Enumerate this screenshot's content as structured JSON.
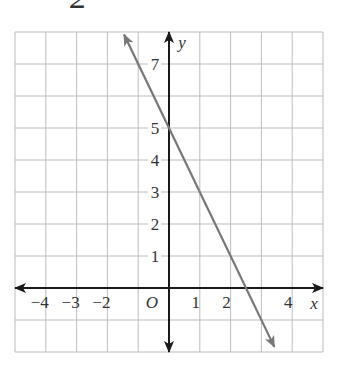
{
  "heading": {
    "text": "2"
  },
  "chart_data": {
    "type": "line",
    "title": "",
    "xlabel": "x",
    "ylabel": "y",
    "xlim": [
      -5,
      5
    ],
    "ylim": [
      -2,
      8
    ],
    "grid": true,
    "origin_label": "O",
    "x_tick_labels": [
      "−4",
      "−3",
      "−2",
      "1",
      "2",
      "4"
    ],
    "x_tick_values": [
      -4,
      -3,
      -2,
      1,
      2,
      4
    ],
    "y_tick_labels": [
      "1",
      "2",
      "3",
      "4",
      "5",
      "7"
    ],
    "y_tick_values": [
      1,
      2,
      3,
      4,
      5,
      7
    ],
    "series": [
      {
        "name": "line",
        "equation": "y = -2x + 5",
        "slope": -2,
        "y_intercept": 5,
        "x_intercept": 2.5,
        "x": [
          -1.46,
          0,
          2.5,
          3.42
        ],
        "y": [
          7.92,
          5,
          0,
          -1.84
        ],
        "color": "#777777",
        "arrows_both_ends": true
      }
    ]
  },
  "colors": {
    "grid": "#bdbdbd",
    "axis": "#1a1a1a",
    "line": "#777777",
    "text": "#333333"
  }
}
